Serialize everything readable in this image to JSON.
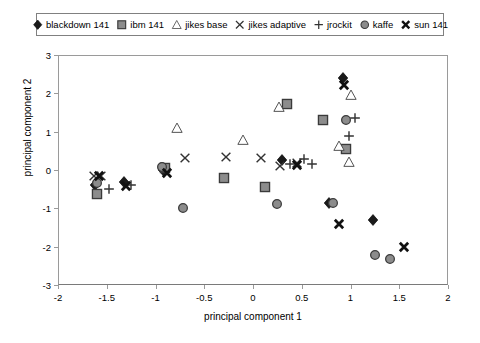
{
  "chart": {
    "type": "scatter",
    "title": "",
    "xlabel": "principal component 1",
    "ylabel": "principal component 2",
    "xlim": [
      -2,
      2
    ],
    "ylim": [
      -3,
      3
    ],
    "xticks": [
      "-2",
      "-1.5",
      "-1",
      "-0.5",
      "0",
      "0.5",
      "1",
      "1.5",
      "2"
    ],
    "xtick_values": [
      -2,
      -1.5,
      -1,
      -0.5,
      0,
      0.5,
      1,
      1.5,
      2
    ],
    "yticks": [
      "3",
      "2",
      "1",
      "0",
      "-1",
      "-2",
      "-3"
    ],
    "ytick_values": [
      3,
      2,
      1,
      0,
      -1,
      -2,
      -3
    ],
    "grid": false,
    "legend_position": "top"
  },
  "legend": {
    "items": [
      {
        "label": "blackdown 141",
        "marker": "diamond",
        "color": "#1a1a1a"
      },
      {
        "label": "ibm 141",
        "marker": "square",
        "color": "#8c8c8c"
      },
      {
        "label": "jikes base",
        "marker": "triangle",
        "color": "#ffffff"
      },
      {
        "label": "jikes adaptive",
        "marker": "x",
        "color": "#333333"
      },
      {
        "label": "jrockit",
        "marker": "plus",
        "color": "#333333"
      },
      {
        "label": "kaffe",
        "marker": "circle",
        "color": "#8c8c8c"
      },
      {
        "label": "sun 141",
        "marker": "boldx",
        "color": "#111111"
      }
    ]
  },
  "chart_data": {
    "type": "scatter",
    "title": "",
    "xlabel": "principal component 1",
    "ylabel": "principal component 2",
    "xlim": [
      -2,
      2
    ],
    "ylim": [
      -3,
      3
    ],
    "grid": false,
    "legend_position": "top",
    "series": [
      {
        "name": "blackdown 141",
        "marker": "diamond",
        "color": "#1a1a1a",
        "points": [
          [
            -1.62,
            -0.38
          ],
          [
            -1.32,
            -0.3
          ],
          [
            -0.92,
            0.0
          ],
          [
            0.3,
            0.27
          ],
          [
            0.78,
            -0.87
          ],
          [
            0.92,
            2.4
          ],
          [
            1.23,
            -1.3
          ]
        ]
      },
      {
        "name": "ibm 141",
        "marker": "square",
        "color": "#8c8c8c",
        "points": [
          [
            -1.6,
            -0.63
          ],
          [
            -0.9,
            0.05
          ],
          [
            -0.3,
            -0.21
          ],
          [
            0.12,
            -0.45
          ],
          [
            0.35,
            1.72
          ],
          [
            0.72,
            1.3
          ],
          [
            0.95,
            0.55
          ]
        ]
      },
      {
        "name": "jikes base",
        "marker": "triangle",
        "color": "#ffffff",
        "points": [
          [
            -0.78,
            1.1
          ],
          [
            -0.1,
            0.78
          ],
          [
            0.27,
            1.65
          ],
          [
            0.88,
            0.62
          ],
          [
            0.98,
            0.2
          ],
          [
            1.0,
            1.95
          ]
        ]
      },
      {
        "name": "jikes adaptive",
        "marker": "x",
        "color": "#333333",
        "points": [
          [
            -1.63,
            -0.15
          ],
          [
            -1.56,
            -0.15
          ],
          [
            -0.7,
            0.32
          ],
          [
            -0.28,
            0.35
          ],
          [
            0.08,
            0.32
          ],
          [
            0.28,
            0.1
          ],
          [
            0.45,
            0.17
          ]
        ]
      },
      {
        "name": "jrockit",
        "marker": "plus",
        "color": "#333333",
        "points": [
          [
            -1.48,
            -0.5
          ],
          [
            -1.25,
            -0.38
          ],
          [
            0.38,
            0.15
          ],
          [
            0.52,
            0.28
          ],
          [
            0.6,
            0.15
          ],
          [
            1.05,
            1.35
          ],
          [
            0.98,
            0.9
          ]
        ]
      },
      {
        "name": "kaffe",
        "marker": "circle",
        "color": "#8c8c8c",
        "points": [
          [
            -1.6,
            -0.35
          ],
          [
            -0.93,
            0.07
          ],
          [
            -0.72,
            -1.0
          ],
          [
            0.25,
            -0.88
          ],
          [
            0.82,
            -0.85
          ],
          [
            0.95,
            1.3
          ],
          [
            1.25,
            -2.22
          ],
          [
            1.4,
            -2.32
          ]
        ]
      },
      {
        "name": "sun 141",
        "marker": "boldx",
        "color": "#111111",
        "points": [
          [
            -1.58,
            -0.16
          ],
          [
            -1.3,
            -0.42
          ],
          [
            -0.88,
            -0.08
          ],
          [
            0.45,
            0.13
          ],
          [
            0.93,
            2.22
          ],
          [
            0.88,
            -1.42
          ],
          [
            1.55,
            -2.0
          ]
        ]
      }
    ]
  }
}
